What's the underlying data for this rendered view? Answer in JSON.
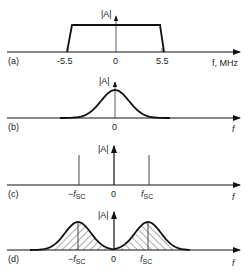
{
  "figure": {
    "panels": [
      {
        "id": "a",
        "label": "(a)",
        "shape": "rectangular-band",
        "y_label": "|A|",
        "x_label": "f, MHz",
        "ticks": [
          "-5.5",
          "0",
          "5.5"
        ],
        "band_edges": [
          -5.5,
          5.5
        ]
      },
      {
        "id": "b",
        "label": "(b)",
        "shape": "gaussian-at-zero",
        "y_label": "|A|",
        "x_label": "f",
        "ticks": [
          "0"
        ]
      },
      {
        "id": "c",
        "label": "(c)",
        "shape": "spectral-lines",
        "y_label": "|A|",
        "x_label": "f",
        "ticks": [
          "−f",
          "0",
          "f"
        ],
        "tick_subscripts": [
          "SC",
          "",
          "SC"
        ]
      },
      {
        "id": "d",
        "label": "(d)",
        "shape": "hatched-gaussians-at-pm-fsc",
        "y_label": "|A|",
        "x_label": "f",
        "ticks": [
          "−f",
          "0",
          "f"
        ],
        "tick_subscripts": [
          "SC",
          "",
          "SC"
        ]
      }
    ],
    "colors": {
      "ink": "#111111",
      "thin": "#333333"
    }
  }
}
